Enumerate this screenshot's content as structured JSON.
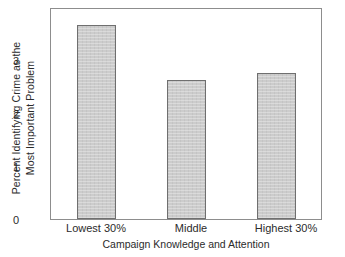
{
  "chart_data": {
    "type": "bar",
    "title": "",
    "categories": [
      "Lowest 30%",
      "Middle",
      "Highest 30%"
    ],
    "values": [
      3.44,
      2.47,
      2.58
    ],
    "xlabel": "Campaign Knowledge and Attention",
    "ylabel": "Percent Identifying Crime as the Most Important Problem",
    "ylabel_lines": [
      "Percent Identifying Crime as the",
      "Most Important Problem"
    ],
    "ylim": [
      0,
      3.72
    ],
    "yticks": [
      0,
      1,
      2,
      3
    ],
    "ytick_labels": [
      "0",
      "1",
      "2",
      "3"
    ],
    "grid": false,
    "legend": null,
    "bar_fill_color": "#c9c9c9",
    "bar_edge_color": "#6f6f6f",
    "frame_color": "#8d8d8d",
    "background_color": "#ffffff"
  }
}
